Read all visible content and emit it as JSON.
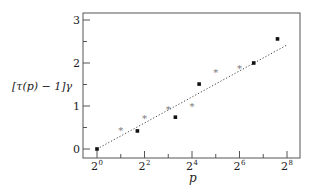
{
  "chart_data": {
    "type": "scatter",
    "title": "",
    "xlabel": "p",
    "ylabel": "[τ(p) − 1]γ",
    "x_scale": "log2",
    "xlim_exponent": [
      0,
      8.6
    ],
    "ylim": [
      0,
      3.2
    ],
    "x_ticks": [
      {
        "exp": 0,
        "label": "2",
        "sup": "0"
      },
      {
        "exp": 2,
        "label": "2",
        "sup": "2"
      },
      {
        "exp": 4,
        "label": "2",
        "sup": "4"
      },
      {
        "exp": 6,
        "label": "2",
        "sup": "6"
      },
      {
        "exp": 8,
        "label": "2",
        "sup": "8"
      }
    ],
    "x_minor_ticks": [
      1,
      3,
      5,
      7
    ],
    "y_ticks": [
      0,
      1,
      2,
      3
    ],
    "y_minor_ticks": [
      0.5,
      1.5,
      2.5
    ],
    "grid": false,
    "series": [
      {
        "name": "dots",
        "marker": "circle",
        "points": [
          {
            "x_exp": 0.0,
            "y": 0.0
          },
          {
            "x_exp": 1.7,
            "y": 0.42
          },
          {
            "x_exp": 3.3,
            "y": 0.74
          },
          {
            "x_exp": 4.3,
            "y": 1.51
          },
          {
            "x_exp": 6.6,
            "y": 2.0
          },
          {
            "x_exp": 7.6,
            "y": 2.56
          }
        ]
      },
      {
        "name": "stars",
        "marker": "star",
        "points": [
          {
            "x_exp": 1.0,
            "y": 0.44
          },
          {
            "x_exp": 2.0,
            "y": 0.72
          },
          {
            "x_exp": 3.0,
            "y": 0.91
          },
          {
            "x_exp": 4.0,
            "y": 1.0
          },
          {
            "x_exp": 5.0,
            "y": 1.77
          },
          {
            "x_exp": 6.0,
            "y": 1.88
          }
        ]
      }
    ],
    "fit_line": {
      "style": "dotted",
      "from": {
        "x_exp": 0,
        "y": 0
      },
      "to": {
        "x_exp": 8,
        "y": 2.42
      }
    }
  }
}
